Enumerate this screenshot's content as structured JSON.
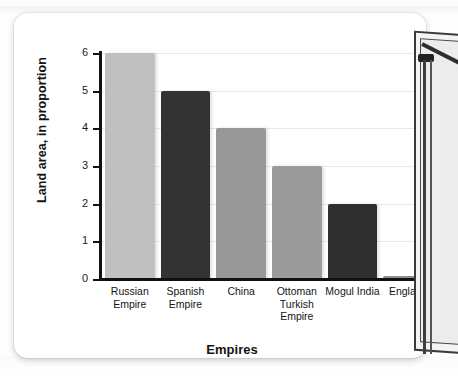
{
  "chart_data": {
    "type": "bar",
    "title": "",
    "xlabel": "Empires",
    "ylabel": "Land area, in proportion",
    "categories": [
      "Russian Empire",
      "Spanish Empire",
      "China",
      "Ottoman Turkish Empire",
      "Mogul India",
      "England"
    ],
    "values": [
      6,
      5,
      4,
      3,
      2,
      0
    ],
    "ylim": [
      0,
      6
    ],
    "yticks": [
      "0",
      "1",
      "2",
      "3",
      "4",
      "5",
      "6"
    ],
    "grid": true,
    "legend": "none",
    "bar_colors": [
      "#c0c0c0",
      "#333333",
      "#989898",
      "#9b9b9b",
      "#2f2f2f",
      "#8f8f8f"
    ]
  },
  "card": {
    "background": "#ffffff"
  },
  "decor": {
    "easel_label": "whiteboard-easel-corner"
  }
}
